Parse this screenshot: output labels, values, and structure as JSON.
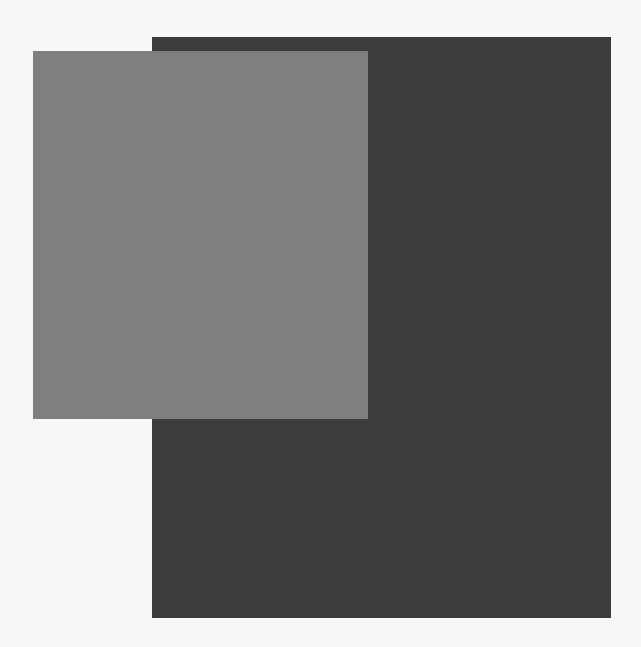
{
  "canvas": {
    "background": "#f7f7f7"
  },
  "shapes": [
    {
      "name": "dark-rectangle",
      "color": "#3c3c3c",
      "left": 152,
      "top": 37,
      "width": 459,
      "height": 581
    },
    {
      "name": "light-rectangle",
      "color": "#7f7f7f",
      "left": 33,
      "top": 51,
      "width": 335,
      "height": 368
    }
  ]
}
